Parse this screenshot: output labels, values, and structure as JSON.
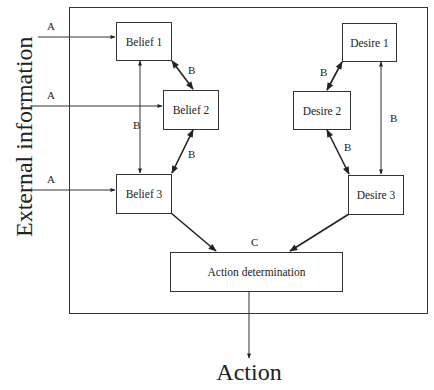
{
  "diagram": {
    "type": "BDI-style belief/desire flow diagram",
    "side_label": "External information",
    "output_label": "Action",
    "nodes": {
      "belief1": "Belief 1",
      "belief2": "Belief 2",
      "belief3": "Belief 3",
      "desire1": "Desire 1",
      "desire2": "Desire 2",
      "desire3": "Desire 3",
      "action_determination": "Action determination"
    },
    "edge_labels": {
      "a1": "A",
      "a2": "A",
      "a3": "A",
      "b_b1_b2": "B",
      "b_b2_b3": "B",
      "b_b1_b3": "B",
      "b_d1_d2": "B",
      "b_d2_d3": "B",
      "b_d1_d3": "B",
      "c": "C"
    },
    "edges": [
      {
        "from": "External information",
        "to": "Belief 1",
        "label": "A",
        "type": "directed"
      },
      {
        "from": "External information",
        "to": "Belief 2",
        "label": "A",
        "type": "directed"
      },
      {
        "from": "External information",
        "to": "Belief 3",
        "label": "A",
        "type": "directed"
      },
      {
        "from": "Belief 1",
        "to": "Belief 2",
        "label": "B",
        "type": "bidirectional"
      },
      {
        "from": "Belief 2",
        "to": "Belief 3",
        "label": "B",
        "type": "bidirectional"
      },
      {
        "from": "Belief 1",
        "to": "Belief 3",
        "label": "B",
        "type": "bidirectional"
      },
      {
        "from": "Desire 1",
        "to": "Desire 2",
        "label": "B",
        "type": "bidirectional"
      },
      {
        "from": "Desire 2",
        "to": "Desire 3",
        "label": "B",
        "type": "bidirectional"
      },
      {
        "from": "Desire 1",
        "to": "Desire 3",
        "label": "B",
        "type": "bidirectional"
      },
      {
        "from": "Belief 3",
        "to": "Action determination",
        "label": "C",
        "type": "directed"
      },
      {
        "from": "Desire 3",
        "to": "Action determination",
        "label": "C",
        "type": "directed"
      },
      {
        "from": "Action determination",
        "to": "Action",
        "label": "",
        "type": "directed"
      }
    ],
    "colors": {
      "stroke": "#333333",
      "text": "#222222",
      "background": "#ffffff"
    }
  }
}
